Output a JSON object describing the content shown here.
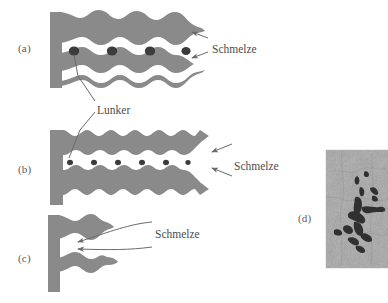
{
  "figure": {
    "background_color": "#ffffff",
    "dendrite_color": "#8a8a8a",
    "melt_channel_color": "#ffffff",
    "pore_color": "#3c3c3c",
    "label_color": "#4d4d4d",
    "leader_color": "#6b6b6b"
  },
  "panels": [
    {
      "id": "a",
      "label": "(a)",
      "label_x": 18,
      "label_y": 42,
      "description": "coarse dendrite arms with large interdendritic melt channels and round shrinkage pores"
    },
    {
      "id": "b",
      "label": "(b)",
      "label_x": 18,
      "label_y": 163,
      "description": "fine dendrite arms with one narrow central melt channel and many small pores"
    },
    {
      "id": "c",
      "label": "(c)",
      "label_x": 18,
      "label_y": 252,
      "description": "short dendrite arms, open melt feeding between arms"
    },
    {
      "id": "d",
      "label": "(d)",
      "label_x": 298,
      "label_y": 212,
      "description": "micrograph of branched interdendritic shrinkage porosity"
    }
  ],
  "callouts": [
    {
      "name": "schmelze-a",
      "text": "Schmelze",
      "x": 212,
      "y": 43,
      "arrows": 2
    },
    {
      "name": "lunker-a",
      "text": "Lunker",
      "x": 97,
      "y": 104,
      "arrows": 1
    },
    {
      "name": "schmelze-b",
      "text": "Schmelze",
      "x": 212,
      "y": 160,
      "arrows": 2
    },
    {
      "name": "schmelze-c",
      "text": "Schmelze",
      "x": 108,
      "y": 234,
      "arrows": 2
    }
  ],
  "micrograph": {
    "x": 326,
    "y": 150,
    "width": 62,
    "height": 118,
    "base_color": "#9a9a9a",
    "feature_color": "#1a1a1a"
  }
}
